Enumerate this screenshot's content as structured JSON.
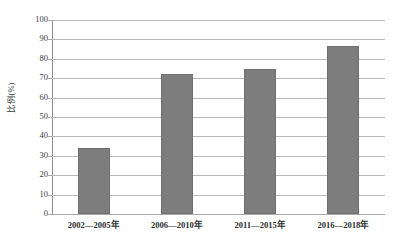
{
  "chart_data": {
    "type": "bar",
    "title": "",
    "xlabel": "",
    "ylabel": "比例(%)",
    "categories": [
      "2002—2005年",
      "2006—2010年",
      "2011—2015年",
      "2016—2018年"
    ],
    "values": [
      34,
      72,
      75,
      86.5
    ],
    "ylim": [
      0,
      100
    ],
    "ytick_step": 10,
    "yticks": [
      "100",
      "90",
      "80",
      "70",
      "60",
      "50",
      "40",
      "30",
      "20",
      "10",
      "0"
    ],
    "grid": true,
    "legend": "none",
    "series": [
      {
        "name": "比例(%)",
        "values": [
          34,
          72,
          75,
          86.5
        ]
      }
    ],
    "colors": {
      "bar_fill": "#7d7d7d",
      "bar_stroke": "#6f6f6f",
      "gridline": "#b9b9b9",
      "axis": "#8e8e8e",
      "background": "#ffffff",
      "text": "#3d3d3d"
    }
  }
}
